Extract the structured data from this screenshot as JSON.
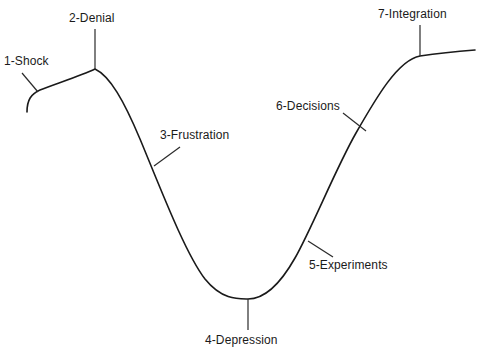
{
  "diagram": {
    "type": "curve-diagram",
    "background_color": "#ffffff",
    "curve_color": "#1a1a1a",
    "label_color": "#1a1a1a",
    "leader_color": "#2b2b2b",
    "canvas": {
      "width": 481,
      "height": 357
    }
  },
  "stages": [
    {
      "id": "shock",
      "label": "1-Shock",
      "label_x": 4,
      "label_y": 54,
      "anchor": {
        "x": 38,
        "y": 92
      },
      "leader_to": {
        "x": 22,
        "y": 73
      }
    },
    {
      "id": "denial",
      "label": "2-Denial",
      "label_x": 69,
      "label_y": 11,
      "anchor": {
        "x": 95,
        "y": 69
      },
      "leader_to": {
        "x": 95,
        "y": 29
      }
    },
    {
      "id": "frustration",
      "label": "3-Frustration",
      "label_x": 160,
      "label_y": 128,
      "anchor": {
        "x": 154,
        "y": 166
      },
      "leader_to": {
        "x": 180,
        "y": 147
      }
    },
    {
      "id": "depression",
      "label": "4-Depression",
      "label_x": 205,
      "label_y": 333,
      "anchor": {
        "x": 248,
        "y": 299
      },
      "leader_to": {
        "x": 248,
        "y": 330
      }
    },
    {
      "id": "experiments",
      "label": "5-Experiments",
      "label_x": 309,
      "label_y": 258,
      "anchor": {
        "x": 308,
        "y": 241
      },
      "leader_to": {
        "x": 333,
        "y": 257
      }
    },
    {
      "id": "decisions",
      "label": "6-Decisions",
      "label_x": 276,
      "label_y": 99,
      "anchor": {
        "x": 366,
        "y": 131
      },
      "leader_to": {
        "x": 343,
        "y": 113
      }
    },
    {
      "id": "integration",
      "label": "7-Integration",
      "label_x": 378,
      "label_y": 7,
      "anchor": {
        "x": 420,
        "y": 56
      },
      "leader_to": {
        "x": 420,
        "y": 25
      }
    }
  ],
  "curve": {
    "path": "M 27 112 C 27 100 31 94 40 90 C 55 84 80 76 95 69 C 110 76 124 101 140 139 C 160 187 185 253 205 279 C 222 300 238 299 248 299 C 262 299 278 288 295 258 C 312 228 336 168 356 133 C 376 98 398 60 420 56 C 440 53 462 51 475 50"
  }
}
